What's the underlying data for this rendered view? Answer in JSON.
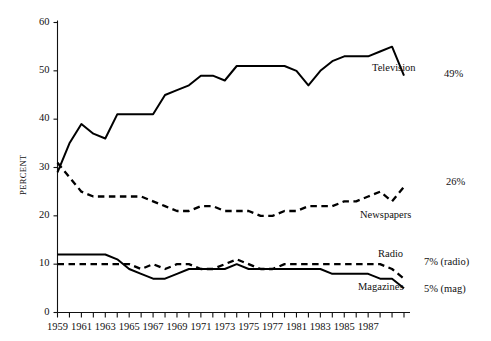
{
  "chart_data": {
    "type": "line",
    "title": "",
    "subtitle": "",
    "xlabel": "",
    "ylabel": "PERCENT",
    "xlim": [
      1959,
      1988
    ],
    "ylim": [
      0,
      60
    ],
    "grid": false,
    "legend_position": "inline-right",
    "y_ticks": [
      0,
      10,
      20,
      30,
      40,
      50,
      60
    ],
    "y_tick_labels": [
      "0",
      "10",
      "20",
      "30",
      "40",
      "50",
      "60"
    ],
    "x_ticks": [
      1959,
      1960,
      1961,
      1962,
      1963,
      1964,
      1965,
      1966,
      1967,
      1968,
      1969,
      1970,
      1971,
      1972,
      1973,
      1974,
      1975,
      1976,
      1977,
      1978,
      1979,
      1980,
      1981,
      1982,
      1983,
      1984,
      1985,
      1986,
      1987,
      1988
    ],
    "x_tick_labels": [
      "1959",
      "1961",
      "1963",
      "1965",
      "1967",
      "1969",
      "1971",
      "1973",
      "1975",
      "1977",
      "1981",
      "1983",
      "1985",
      "1987"
    ],
    "x_tick_label_years": [
      1959,
      1961,
      1963,
      1965,
      1967,
      1969,
      1971,
      1973,
      1975,
      1977,
      1979,
      1981,
      1983,
      1985
    ],
    "x": [
      1959,
      1960,
      1961,
      1962,
      1963,
      1964,
      1965,
      1966,
      1967,
      1968,
      1969,
      1970,
      1971,
      1972,
      1973,
      1974,
      1975,
      1976,
      1977,
      1978,
      1979,
      1980,
      1981,
      1982,
      1983,
      1984,
      1985,
      1986,
      1987,
      1988
    ],
    "series": [
      {
        "name": "Television",
        "style": "solid",
        "color": "#000000",
        "label": "Television",
        "end_value_label": "49%",
        "values": [
          29,
          35,
          39,
          37,
          36,
          41,
          41,
          41,
          41,
          45,
          46,
          47,
          49,
          49,
          48,
          51,
          51,
          51,
          51,
          51,
          50,
          47,
          50,
          52,
          53,
          53,
          53,
          54,
          55,
          49
        ]
      },
      {
        "name": "Newspapers",
        "style": "dashed",
        "color": "#000000",
        "label": "Newspapers",
        "end_value_label": "26%",
        "values": [
          31,
          28,
          25,
          24,
          24,
          24,
          24,
          24,
          23,
          22,
          21,
          21,
          22,
          22,
          21,
          21,
          21,
          20,
          20,
          21,
          21,
          22,
          22,
          22,
          23,
          23,
          24,
          25,
          23,
          26
        ]
      },
      {
        "name": "Radio",
        "style": "dashed",
        "color": "#000000",
        "label": "Radio",
        "end_value_label": "7% (radio)",
        "values": [
          10,
          10,
          10,
          10,
          10,
          10,
          10,
          9,
          10,
          9,
          10,
          10,
          9,
          9,
          10,
          11,
          10,
          9,
          9,
          10,
          10,
          10,
          10,
          10,
          10,
          10,
          10,
          10,
          9,
          7
        ]
      },
      {
        "name": "Magazines",
        "style": "solid",
        "color": "#000000",
        "label": "Magazines",
        "end_value_label": "5% (mag)",
        "values": [
          12,
          12,
          12,
          12,
          12,
          11,
          9,
          8,
          7,
          7,
          8,
          9,
          9,
          9,
          9,
          10,
          9,
          9,
          9,
          9,
          9,
          9,
          9,
          8,
          8,
          8,
          8,
          7,
          7,
          5
        ]
      }
    ]
  }
}
